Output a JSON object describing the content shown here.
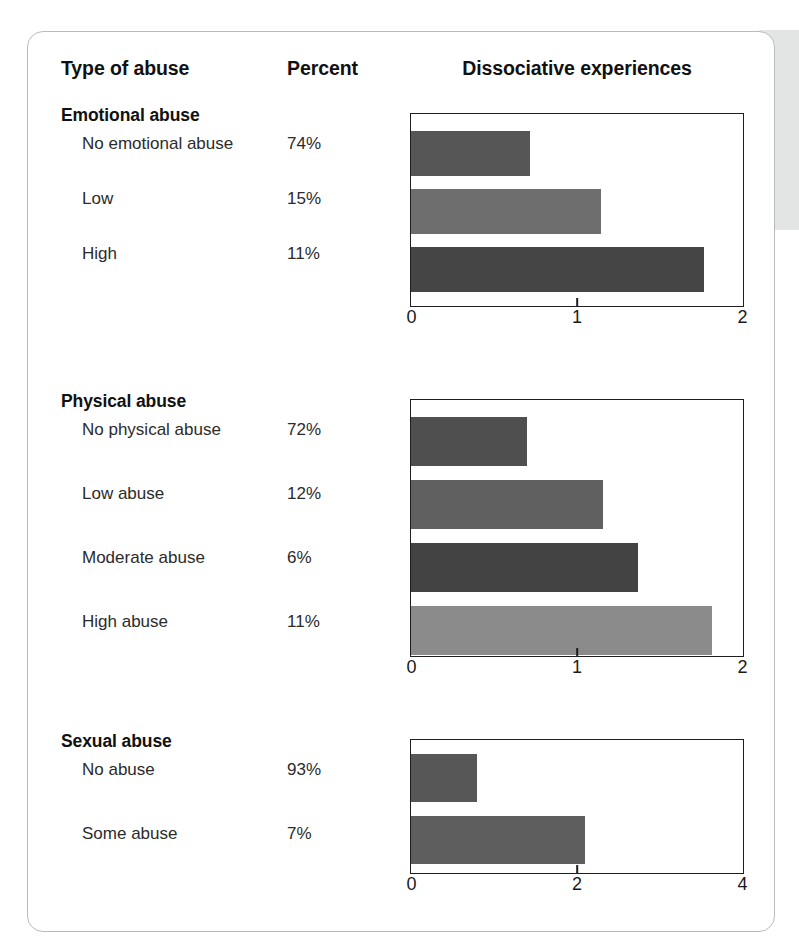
{
  "header": {
    "col_type": "Type of abuse",
    "col_percent": "Percent",
    "col_chart": "Dissociative experiences"
  },
  "chart_data": {
    "type": "bar",
    "orientation": "horizontal",
    "title": "Dissociative experiences",
    "xlabel": "",
    "ylabel": "Type of abuse",
    "grid": false,
    "legend": false,
    "panels": [
      {
        "title": "Emotional abuse",
        "xlim": [
          0,
          2
        ],
        "ticks": [
          0,
          1,
          2
        ],
        "tick_labels": [
          "0",
          "1",
          "2"
        ],
        "categories": [
          "No emotional abuse",
          "Low",
          "High"
        ],
        "percents": [
          "74%",
          "15%",
          "11%"
        ],
        "values": [
          0.72,
          1.15,
          1.77
        ],
        "colors": [
          "#565656",
          "#6e6e6e",
          "#454545"
        ]
      },
      {
        "title": "Physical abuse",
        "xlim": [
          0,
          2
        ],
        "ticks": [
          0,
          1,
          2
        ],
        "tick_labels": [
          "0",
          "1",
          "2"
        ],
        "categories": [
          "No physical abuse",
          "Low abuse",
          "Moderate abuse",
          "High abuse"
        ],
        "percents": [
          "72%",
          "12%",
          "6%",
          "11%"
        ],
        "values": [
          0.7,
          1.16,
          1.37,
          1.82
        ],
        "colors": [
          "#4f4f4f",
          "#606060",
          "#434343",
          "#8b8b8b"
        ]
      },
      {
        "title": "Sexual abuse",
        "xlim": [
          0,
          4
        ],
        "ticks": [
          0,
          2,
          4
        ],
        "tick_labels": [
          "0",
          "2",
          "4"
        ],
        "categories": [
          "No abuse",
          "Some abuse"
        ],
        "percents": [
          "93%",
          "7%"
        ],
        "values": [
          0.8,
          2.1
        ],
        "colors": [
          "#575757",
          "#5e5e5e"
        ]
      }
    ]
  },
  "style": {
    "axis_color": "#1e1e1e",
    "card_border": "#b9bcbb",
    "text_color": "#1a1a1a",
    "edge_strip": "#e3e5e4"
  }
}
